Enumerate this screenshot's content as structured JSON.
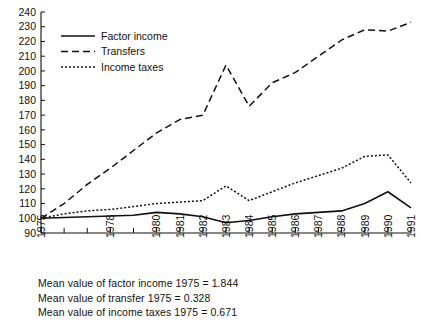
{
  "chart_data": {
    "type": "line",
    "title": "",
    "subtitle": "",
    "xlabel": "",
    "ylabel": "",
    "xlim": [
      1975,
      1991
    ],
    "ylim": [
      90,
      240
    ],
    "yticks": [
      90,
      100,
      110,
      120,
      130,
      140,
      150,
      160,
      170,
      180,
      190,
      200,
      210,
      220,
      230,
      240
    ],
    "ytick_labels": [
      "90",
      "100",
      "110",
      "120",
      "130",
      "140",
      "150",
      "160",
      "170",
      "180",
      "190",
      "200",
      "210",
      "220",
      "230",
      "240"
    ],
    "x": [
      1975,
      1976,
      1977,
      1978,
      1979,
      1980,
      1981,
      1982,
      1983,
      1984,
      1985,
      1986,
      1987,
      1988,
      1989,
      1990,
      1991
    ],
    "xticks": [
      1975,
      1976,
      1977,
      1978,
      1979,
      1980,
      1981,
      1982,
      1983,
      1984,
      1985,
      1986,
      1987,
      1988,
      1989,
      1990,
      1991
    ],
    "xtick_labels": [
      "1975",
      "",
      "",
      "1978",
      "",
      "1980",
      "1981",
      "1982",
      "1983",
      "1984",
      "1985",
      "1986",
      "1987",
      "1988",
      "1989",
      "1990",
      "1991"
    ],
    "grid": false,
    "legend_position": "upper-left",
    "series": [
      {
        "name": "Factor income",
        "style": "solid",
        "color": "#101010",
        "values": [
          100,
          100.5,
          101,
          101.5,
          102,
          104,
          103,
          101,
          97,
          98.5,
          101,
          103,
          104,
          105,
          110,
          118,
          107
        ]
      },
      {
        "name": "Transfers",
        "style": "dashed",
        "color": "#101010",
        "values": [
          100,
          110,
          123,
          134,
          146,
          158,
          167,
          170,
          204,
          176,
          192,
          199,
          210,
          221,
          228,
          227,
          233
        ]
      },
      {
        "name": "Income taxes",
        "style": "dotted",
        "color": "#101010",
        "values": [
          100,
          103,
          105,
          106,
          108,
          110,
          111,
          112,
          122,
          112,
          118,
          124,
          129,
          134,
          142,
          143,
          124
        ]
      }
    ]
  },
  "legend": {
    "items": [
      {
        "label": "Factor income",
        "style": "solid"
      },
      {
        "label": "Transfers",
        "style": "dashed"
      },
      {
        "label": "Income taxes",
        "style": "dotted"
      }
    ]
  },
  "caption": {
    "lines": [
      "Mean value of factor income 1975 = 1.844",
      "Mean value of transfer 1975 = 0.328",
      "Mean value of income taxes 1975 = 0.671"
    ]
  }
}
